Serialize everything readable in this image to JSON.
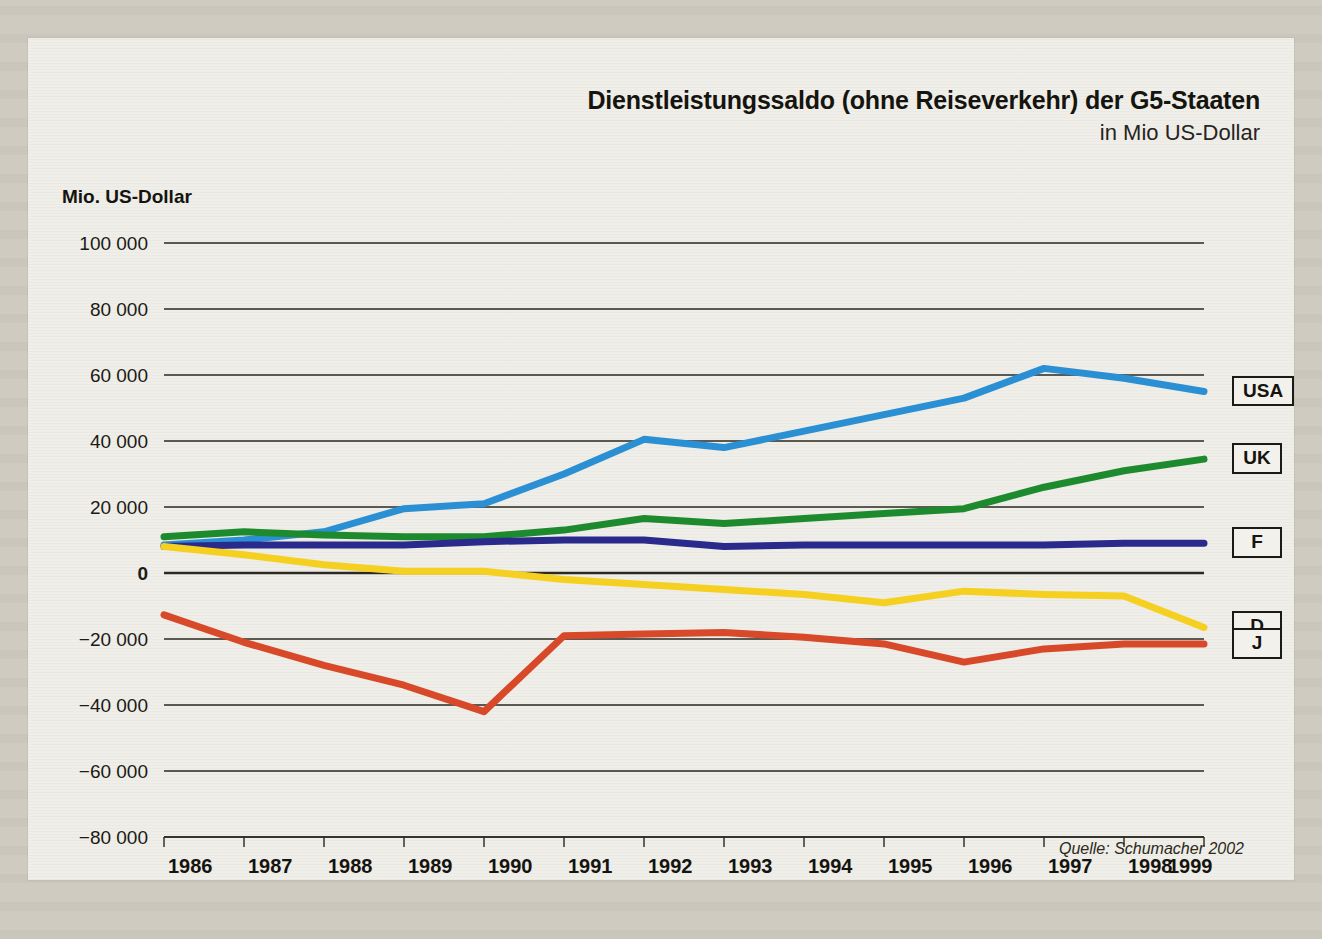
{
  "figure": {
    "title": "Dienstleistungssaldo (ohne Reiseverkehr) der G5-Staaten",
    "subtitle": "in Mio US-Dollar",
    "y_axis_caption": "Mio. US-Dollar",
    "source": "Quelle: Schumacher 2002"
  },
  "legend": [
    {
      "key": "USA",
      "label": "USA",
      "color": "#2b8fd4",
      "y_value": 55000
    },
    {
      "key": "UK",
      "label": "UK",
      "color": "#1e8a2e",
      "y_value": 34500
    },
    {
      "key": "F",
      "label": "F",
      "color": "#2a2a8c",
      "y_value": 9000
    },
    {
      "key": "D",
      "label": "D",
      "color": "#f5d020",
      "y_value": -16500
    },
    {
      "key": "J",
      "label": "J",
      "color": "#d8492a",
      "y_value": -21500
    }
  ],
  "chart_data": {
    "type": "line",
    "title": "Dienstleistungssaldo (ohne Reiseverkehr) der G5-Staaten",
    "subtitle": "in Mio US-Dollar",
    "xlabel": "",
    "ylabel": "Mio. US-Dollar",
    "grid": true,
    "legend_position": "right",
    "ylim": [
      -80000,
      100000
    ],
    "yticks": [
      100000,
      80000,
      60000,
      40000,
      20000,
      0,
      -20000,
      -40000,
      -60000,
      -80000
    ],
    "ytick_labels": [
      "100 000",
      "80 000",
      "60 000",
      "40 000",
      "20 000",
      "0",
      "−20 000",
      "−40 000",
      "−60 000",
      "−80 000"
    ],
    "categories": [
      1986,
      1987,
      1988,
      1989,
      1990,
      1991,
      1992,
      1993,
      1994,
      1995,
      1996,
      1997,
      1998,
      1999
    ],
    "xtick_labels": [
      "1986",
      "1987",
      "1988",
      "1989",
      "1990",
      "1991",
      "1992",
      "1993",
      "1994",
      "1995",
      "1996",
      "1997",
      "1998",
      "1999"
    ],
    "series": [
      {
        "name": "USA",
        "color": "#2b8fd4",
        "values": [
          8500,
          10000,
          12500,
          19500,
          21000,
          30000,
          40500,
          38000,
          43000,
          48000,
          53000,
          62000,
          59000,
          55000
        ]
      },
      {
        "name": "UK",
        "color": "#1e8a2e",
        "values": [
          11000,
          12500,
          11500,
          11000,
          11000,
          13000,
          16500,
          15000,
          16500,
          18000,
          19500,
          26000,
          31000,
          34500
        ]
      },
      {
        "name": "F",
        "color": "#2a2a8c",
        "values": [
          8000,
          8500,
          8500,
          8500,
          9500,
          10000,
          10000,
          8000,
          8500,
          8500,
          8500,
          8500,
          9000,
          9000
        ]
      },
      {
        "name": "D",
        "color": "#f5d020",
        "values": [
          8000,
          5500,
          2500,
          500,
          500,
          -2000,
          -3500,
          -5000,
          -6500,
          -9000,
          -5500,
          -6500,
          -7000,
          -16500
        ]
      },
      {
        "name": "J",
        "color": "#d8492a",
        "values": [
          -12700,
          -21000,
          -28000,
          -34000,
          -42000,
          -19000,
          -18500,
          -18000,
          -19500,
          -21500,
          -27000,
          -23000,
          -21500,
          -21500
        ]
      }
    ]
  }
}
